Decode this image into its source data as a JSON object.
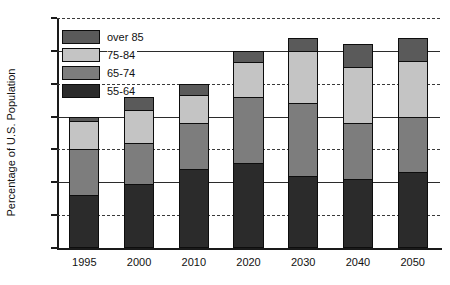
{
  "chart_data": {
    "type": "bar",
    "stacked": true,
    "title": "",
    "xlabel": "",
    "ylabel": "Percentage of U.S. Population",
    "categories": [
      "1995",
      "2000",
      "2010",
      "2020",
      "2030",
      "2040",
      "2050"
    ],
    "ylim": [
      0,
      35
    ],
    "yticks": [
      0,
      5,
      10,
      15,
      20,
      25,
      30,
      35
    ],
    "ytick_labels": [
      "0",
      "5",
      "10",
      "15",
      "20",
      "25",
      "30",
      "35"
    ],
    "grid": true,
    "legend_position": "upper-left",
    "series": [
      {
        "name": "55-64",
        "color": "#2b2b2b",
        "values": [
          8.0,
          9.8,
          12.0,
          13.0,
          11.0,
          10.5,
          11.5
        ]
      },
      {
        "name": "65-74",
        "color": "#7d7d7d",
        "values": [
          7.0,
          6.2,
          7.0,
          10.0,
          11.0,
          8.5,
          8.5
        ]
      },
      {
        "name": "75-84",
        "color": "#c4c4c4",
        "values": [
          4.3,
          5.0,
          4.3,
          5.3,
          8.0,
          8.5,
          8.5
        ]
      },
      {
        "name": "over 85",
        "color": "#5a5a5a",
        "values": [
          0.7,
          2.0,
          1.7,
          1.7,
          2.0,
          3.5,
          3.5
        ]
      }
    ],
    "totals": [
      20.0,
      23.0,
      25.0,
      30.0,
      32.0,
      31.0,
      32.0
    ],
    "legend_order": [
      "over 85",
      "75-84",
      "65-74",
      "55-64"
    ]
  },
  "colors": {
    "axis": "#1a1a1a",
    "grid": "#2b2b2b",
    "text": "#111111",
    "background": "#ffffff",
    "series_55_64": "#2b2b2b",
    "series_65_74": "#7d7d7d",
    "series_75_84": "#c4c4c4",
    "series_over_85": "#5a5a5a"
  }
}
